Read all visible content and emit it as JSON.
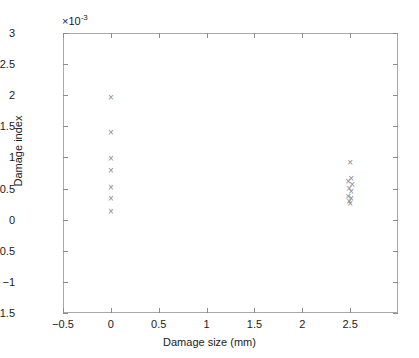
{
  "chart_data": {
    "type": "scatter",
    "title": "",
    "xlabel": "Damage size (mm)",
    "ylabel": "Damage index",
    "y_exponent_label": "×10",
    "y_exponent_power": "-3",
    "y_scale": 0.001,
    "xlim": [
      -0.5,
      3.0
    ],
    "ylim": [
      -0.0015,
      0.003
    ],
    "grid": false,
    "legend": null,
    "marker": "x",
    "marker_color": "#8a8a8a",
    "xticks": [
      -0.5,
      0,
      0.5,
      1,
      1.5,
      2,
      2.5
    ],
    "xticklabels": [
      "−0.5",
      "0",
      "0.5",
      "1",
      "1.5",
      "2",
      "2.5"
    ],
    "yticks": [
      -0.0015,
      -0.001,
      -0.0005,
      0,
      0.0005,
      0.001,
      0.0015,
      0.002,
      0.0025,
      0.003
    ],
    "yticklabels": [
      "−1.5",
      "−1",
      "−0.5",
      "0",
      "0.5",
      "1",
      "1.5",
      "2",
      "2.5",
      "3"
    ],
    "series": [
      {
        "name": "Damage index measurements",
        "points": [
          {
            "x": 0.0,
            "y": 0.00196
          },
          {
            "x": 0.0,
            "y": 0.0014
          },
          {
            "x": 0.0,
            "y": 0.00098
          },
          {
            "x": 0.0,
            "y": 0.00079
          },
          {
            "x": 0.0,
            "y": 0.00052
          },
          {
            "x": 0.0,
            "y": 0.00034
          },
          {
            "x": 0.0,
            "y": 0.00013
          },
          {
            "x": 2.5,
            "y": 0.00092
          },
          {
            "x": 2.51,
            "y": 0.00066
          },
          {
            "x": 2.48,
            "y": 0.00062
          },
          {
            "x": 2.52,
            "y": 0.00056
          },
          {
            "x": 2.49,
            "y": 0.0005
          },
          {
            "x": 2.51,
            "y": 0.00045
          },
          {
            "x": 2.48,
            "y": 0.00038
          },
          {
            "x": 2.51,
            "y": 0.00034
          },
          {
            "x": 2.49,
            "y": 0.0003
          },
          {
            "x": 2.5,
            "y": 0.00026
          }
        ]
      }
    ]
  }
}
